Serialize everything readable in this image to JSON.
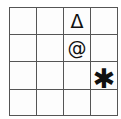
{
  "diagram": {
    "type": "symbol-grid",
    "rows": 4,
    "columns": 4,
    "line_color": "#555555",
    "cell_background": "#fdfdfd",
    "symbol_color": "#111111",
    "cells": [
      [
        {
          "symbol": "",
          "name": "empty"
        },
        {
          "symbol": "",
          "name": "empty"
        },
        {
          "symbol": "Δ",
          "name": "delta-triangle"
        },
        {
          "symbol": "",
          "name": "empty"
        }
      ],
      [
        {
          "symbol": "",
          "name": "empty"
        },
        {
          "symbol": "",
          "name": "empty"
        },
        {
          "symbol": "@",
          "name": "at-sign"
        },
        {
          "symbol": "",
          "name": "empty"
        }
      ],
      [
        {
          "symbol": "",
          "name": "empty"
        },
        {
          "symbol": "",
          "name": "empty"
        },
        {
          "symbol": "",
          "name": "empty"
        },
        {
          "symbol": "✱",
          "name": "heavy-asterisk"
        }
      ],
      [
        {
          "symbol": "",
          "name": "empty"
        },
        {
          "symbol": "",
          "name": "empty"
        },
        {
          "symbol": "",
          "name": "empty"
        },
        {
          "symbol": "",
          "name": "empty"
        }
      ]
    ]
  }
}
